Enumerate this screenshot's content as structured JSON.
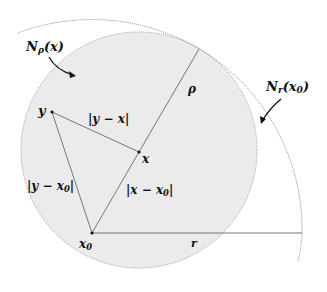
{
  "diagram": {
    "type": "geometry-neighborhoods",
    "colors": {
      "inner_disk_fill": "#ebebeb",
      "inner_disk_stroke": "#9a9a9a",
      "outer_arc_stroke": "#8a8a8a",
      "segment_stroke": "#777777",
      "text": "#111111",
      "background": "#ffffff"
    },
    "points": {
      "y": {
        "label": "y",
        "x": 52,
        "y": 112
      },
      "x": {
        "label": "x",
        "x": 139,
        "y": 152
      },
      "x0": {
        "label": "x",
        "sub": "0",
        "x": 92,
        "y": 233
      }
    },
    "inner_disk": {
      "label_main": "N",
      "label_sub": "ρ",
      "label_arg": "(x)",
      "cx": 139,
      "cy": 150,
      "r": 118
    },
    "outer_disk": {
      "label_main": "N",
      "label_sub": "r",
      "label_arg": "(x0)",
      "cx": 92,
      "cy": 233,
      "r": 210
    },
    "segment_labels": {
      "y_minus_x": "|y − x|",
      "y_minus_x0": "|y − x0|",
      "x_minus_x0": "|x − x0|",
      "rho": "ρ",
      "r": "r"
    },
    "text": {
      "n_rho_main": "N",
      "n_rho_sub": "ρ",
      "n_rho_arg": "(x)",
      "n_r_main": "N",
      "n_r_sub": "r",
      "n_r_arg": "(x",
      "n_r_arg_sub": "0",
      "n_r_arg_close": ")",
      "y_label": "y",
      "x_label": "x",
      "x0_label": "x",
      "x0_sub": "0",
      "rho_label": "ρ",
      "r_label": "r",
      "yx_label": "|y − x|",
      "yx0_label_main": "|y − x",
      "yx0_label_sub": "0",
      "yx0_label_close": "|",
      "xx0_label_main": "|x − x",
      "xx0_label_sub": "0",
      "xx0_label_close": "|"
    }
  }
}
